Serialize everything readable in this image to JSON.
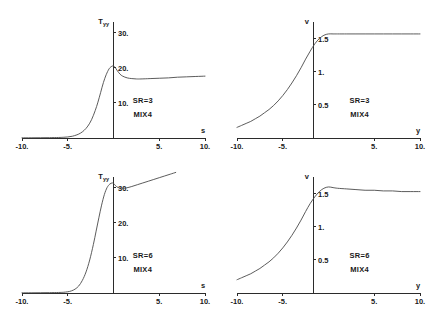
{
  "figure": {
    "panel_count": 4,
    "background_color": "#ffffff",
    "curve_color": "#4a4a4a",
    "axis_color": "#2b2b2b"
  },
  "chart_data": [
    {
      "id": "panel-top-left",
      "type": "line",
      "title": "",
      "xlabel": "s",
      "ylabel": "T",
      "ylabel_sub": "yy",
      "xlim": [
        -10,
        10
      ],
      "ylim": [
        0,
        33
      ],
      "grid": false,
      "legend": "none",
      "xticks": [
        -10,
        -5,
        5,
        10
      ],
      "xticklabels": [
        "-10.",
        "-5.",
        "5.",
        "10."
      ],
      "yticks": [
        10,
        20,
        30
      ],
      "yticklabels": [
        "10.",
        "20.",
        "30."
      ],
      "annotations": [
        "SR=3",
        "MIX4"
      ],
      "series": [
        {
          "name": "Tyy SR=3",
          "x": [
            -10,
            -9,
            -8,
            -7,
            -6,
            -5.5,
            -5,
            -4.5,
            -4,
            -3.6,
            -3.2,
            -2.8,
            -2.4,
            -2,
            -1.7,
            -1.4,
            -1.1,
            -0.8,
            -0.5,
            -0.25,
            0,
            0.2,
            0.4,
            0.7,
            1,
            1.5,
            2,
            2.5,
            3,
            4,
            5,
            6,
            7,
            8,
            9,
            10
          ],
          "y": [
            0.05,
            0.06,
            0.08,
            0.1,
            0.15,
            0.2,
            0.3,
            0.5,
            0.9,
            1.4,
            2.2,
            3.4,
            5.2,
            7.8,
            10.2,
            13.0,
            15.8,
            18.0,
            19.6,
            20.3,
            20.5,
            20.0,
            19.2,
            18.2,
            17.6,
            17.1,
            16.9,
            16.8,
            16.8,
            16.9,
            17.0,
            17.1,
            17.3,
            17.4,
            17.5,
            17.6
          ]
        }
      ]
    },
    {
      "id": "panel-top-right",
      "type": "line",
      "title": "",
      "xlabel": "y",
      "ylabel": "v",
      "ylabel_sub": "",
      "xlim": [
        -10,
        10
      ],
      "ylim": [
        0,
        1.75
      ],
      "grid": false,
      "legend": "none",
      "xticks": [
        -10,
        -5,
        5,
        10
      ],
      "xticklabels": [
        "-10.",
        "-5.",
        "5.",
        "10."
      ],
      "yticks": [
        0.5,
        1,
        1.5
      ],
      "yticklabels": [
        "0.5",
        "1.",
        "1.5"
      ],
      "annotations": [
        "SR=3",
        "MIX4"
      ],
      "series": [
        {
          "name": "v SR=3",
          "x": [
            -10,
            -9.5,
            -9,
            -8.5,
            -8,
            -7.5,
            -7,
            -6.5,
            -6,
            -5.5,
            -5,
            -4.5,
            -4,
            -3.5,
            -3,
            -2.5,
            -2,
            -1.5,
            -1,
            -0.5,
            0,
            0.5,
            1,
            2,
            3,
            4,
            5,
            6,
            7,
            8,
            9,
            10
          ],
          "y": [
            0.16,
            0.19,
            0.22,
            0.25,
            0.29,
            0.33,
            0.38,
            0.43,
            0.49,
            0.56,
            0.64,
            0.73,
            0.83,
            0.94,
            1.06,
            1.19,
            1.31,
            1.42,
            1.5,
            1.55,
            1.57,
            1.57,
            1.57,
            1.57,
            1.57,
            1.57,
            1.57,
            1.57,
            1.57,
            1.57,
            1.57,
            1.57
          ]
        }
      ]
    },
    {
      "id": "panel-bottom-left",
      "type": "line",
      "title": "",
      "xlabel": "s",
      "ylabel": "T",
      "ylabel_sub": "yy",
      "xlim": [
        -10,
        10
      ],
      "ylim": [
        0,
        33
      ],
      "grid": false,
      "legend": "none",
      "xticks": [
        -10,
        -5,
        5,
        10
      ],
      "xticklabels": [
        "-10.",
        "-5.",
        "5.",
        "10."
      ],
      "yticks": [
        10,
        20,
        30
      ],
      "yticklabels": [
        "10.",
        "20.",
        "30."
      ],
      "annotations": [
        "SR=6",
        "MIX4"
      ],
      "series": [
        {
          "name": "Tyy SR=6",
          "x": [
            -10,
            -9,
            -8,
            -7,
            -6,
            -5.5,
            -5,
            -4.6,
            -4.2,
            -3.8,
            -3.4,
            -3,
            -2.6,
            -2.2,
            -1.9,
            -1.6,
            -1.3,
            -1,
            -0.7,
            -0.4,
            -0.15,
            0,
            0.2,
            0.5,
            0.9,
            1.4,
            2,
            2.6,
            3.2,
            3.8,
            4.4,
            5,
            5.6,
            6.2,
            6.8
          ],
          "y": [
            0.05,
            0.06,
            0.08,
            0.1,
            0.15,
            0.2,
            0.35,
            0.6,
            1.1,
            2.0,
            3.6,
            6.0,
            9.4,
            13.8,
            17.6,
            21.4,
            25.0,
            28.0,
            30.0,
            31.0,
            31.3,
            31.2,
            30.6,
            30.0,
            29.8,
            29.9,
            30.3,
            30.8,
            31.3,
            31.8,
            32.3,
            32.8,
            33.3,
            33.8,
            34.3
          ]
        }
      ]
    },
    {
      "id": "panel-bottom-right",
      "type": "line",
      "title": "",
      "xlabel": "y",
      "ylabel": "v",
      "ylabel_sub": "",
      "xlim": [
        -10,
        10
      ],
      "ylim": [
        0,
        1.75
      ],
      "grid": false,
      "legend": "none",
      "xticks": [
        -10,
        -5,
        5,
        10
      ],
      "xticklabels": [
        "-10.",
        "-5.",
        "5.",
        "10."
      ],
      "yticks": [
        0.5,
        1,
        1.5
      ],
      "yticklabels": [
        "0.5",
        "1.",
        "1.5"
      ],
      "annotations": [
        "SR=6",
        "MIX4"
      ],
      "series": [
        {
          "name": "v SR=6",
          "x": [
            -10,
            -9.5,
            -9,
            -8.5,
            -8,
            -7.5,
            -7,
            -6.5,
            -6,
            -5.5,
            -5,
            -4.5,
            -4,
            -3.5,
            -3,
            -2.5,
            -2,
            -1.5,
            -1,
            -0.5,
            0,
            0.5,
            1,
            2,
            3,
            4,
            5,
            6,
            7,
            8,
            9,
            10
          ],
          "y": [
            0.2,
            0.23,
            0.26,
            0.29,
            0.33,
            0.37,
            0.42,
            0.47,
            0.53,
            0.6,
            0.68,
            0.77,
            0.87,
            0.98,
            1.1,
            1.23,
            1.35,
            1.45,
            1.53,
            1.58,
            1.6,
            1.59,
            1.58,
            1.57,
            1.56,
            1.55,
            1.55,
            1.54,
            1.54,
            1.53,
            1.53,
            1.53
          ]
        }
      ]
    }
  ]
}
